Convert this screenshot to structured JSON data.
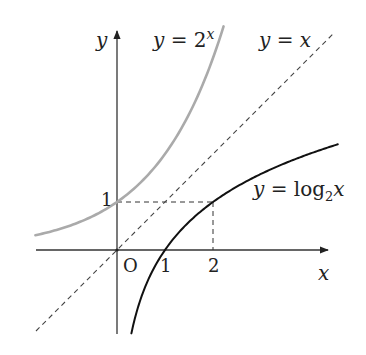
{
  "figure": {
    "origin_label": "O",
    "axes": {
      "x_label": "x",
      "y_label": "y",
      "x_ticks": [
        {
          "value": 1,
          "label": "1"
        },
        {
          "value": 2,
          "label": "2"
        }
      ],
      "y_ticks": [
        {
          "value": 1,
          "label": "1"
        }
      ]
    },
    "curves": [
      {
        "id": "exp",
        "label_lhs": "y",
        "label_eq": " = 2",
        "label_sup": "x",
        "color": "#aaaaaa",
        "style": "solid"
      },
      {
        "id": "identity",
        "label_lhs": "y",
        "label_eq": " = ",
        "label_rhs": "x",
        "color": "#444444",
        "style": "dashed"
      },
      {
        "id": "log",
        "label_lhs": "y",
        "label_eq": " = log",
        "label_sub": "2",
        "label_rhs": "x",
        "color": "#111111",
        "style": "solid"
      }
    ],
    "guides": [
      {
        "from": [
          0,
          1
        ],
        "to": [
          2,
          1
        ],
        "style": "dashed"
      },
      {
        "from": [
          2,
          1
        ],
        "to": [
          2,
          0
        ],
        "style": "dashed"
      }
    ],
    "layout": {
      "origin_px": [
        117,
        250
      ],
      "unit_px": 48,
      "x_range": [
        -1.7,
        4.6
      ],
      "y_range": [
        -1.75,
        4.6
      ]
    }
  }
}
